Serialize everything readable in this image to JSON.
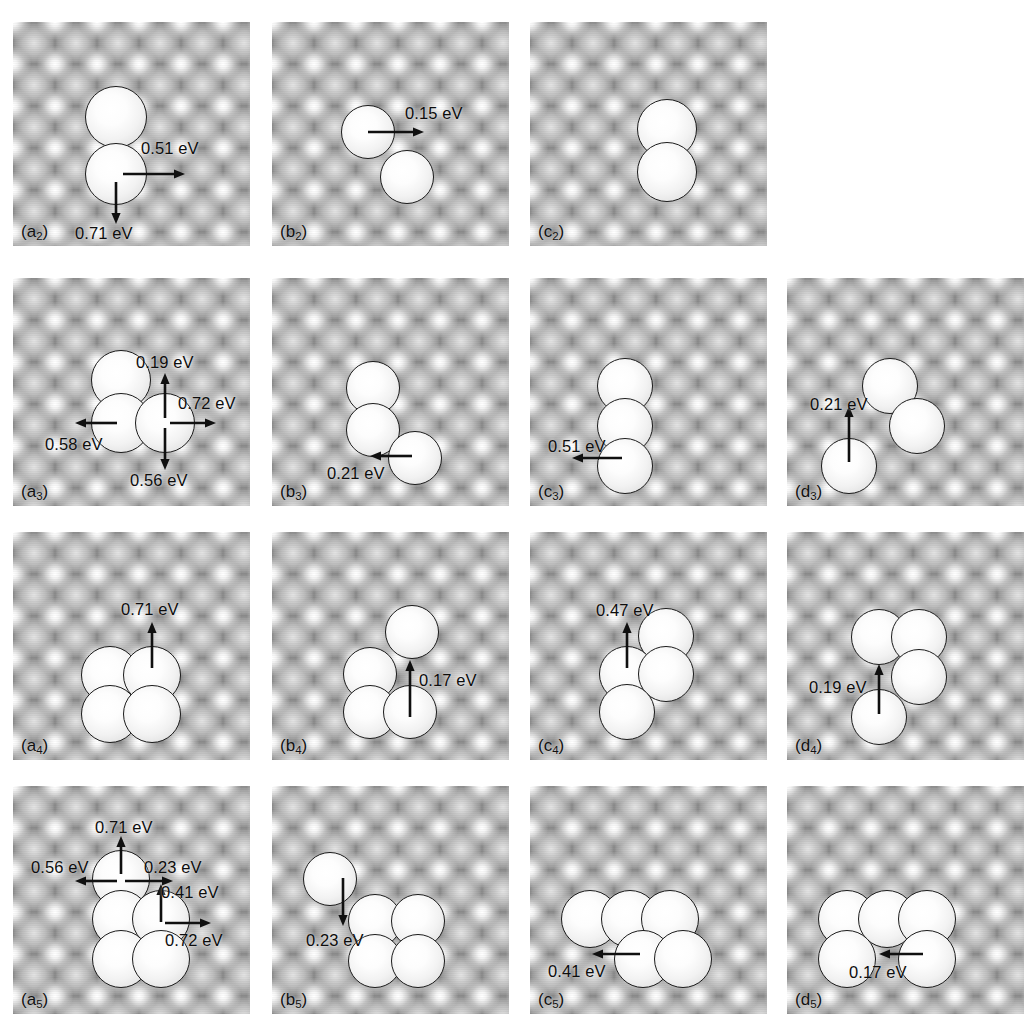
{
  "figure": {
    "kind": "surface-diffusion-mechanism-figure",
    "energy_unit": "eV",
    "columns": 4,
    "rows": 4
  },
  "panels": [
    {
      "id": "a2",
      "caption_main": "(a",
      "caption_sub": "2",
      "caption_tail": ")",
      "cluster_size": 2,
      "col": 0,
      "row": 0,
      "x": 13,
      "y": 22,
      "w": 237,
      "h": 224,
      "atoms": [
        {
          "cx": 103,
          "cy": 95,
          "r": 31
        },
        {
          "cx": 103,
          "cy": 152,
          "r": 31
        }
      ],
      "arrows": [
        {
          "name": "arrow-right",
          "x1": 110,
          "y1": 152,
          "x2": 172,
          "y2": 152
        },
        {
          "name": "arrow-down",
          "x1": 103,
          "y1": 160,
          "x2": 103,
          "y2": 202
        }
      ],
      "labels": [
        {
          "text": "0.51 eV",
          "x": 128,
          "y": 118,
          "value": 0.51
        },
        {
          "text": "0.71 eV",
          "x": 62,
          "y": 203,
          "value": 0.71
        }
      ]
    },
    {
      "id": "b2",
      "caption_main": "(b",
      "caption_sub": "2",
      "caption_tail": ")",
      "cluster_size": 2,
      "col": 1,
      "row": 0,
      "x": 272,
      "y": 22,
      "w": 237,
      "h": 224,
      "atoms": [
        {
          "cx": 96,
          "cy": 110,
          "r": 27
        },
        {
          "cx": 135,
          "cy": 155,
          "r": 27
        }
      ],
      "arrows": [
        {
          "name": "arrow-right",
          "x1": 96,
          "y1": 110,
          "x2": 152,
          "y2": 110
        }
      ],
      "labels": [
        {
          "text": "0.15 eV",
          "x": 133,
          "y": 83,
          "value": 0.15
        }
      ]
    },
    {
      "id": "c2",
      "caption_main": "(c",
      "caption_sub": "2",
      "caption_tail": ")",
      "cluster_size": 2,
      "col": 2,
      "row": 0,
      "x": 530,
      "y": 22,
      "w": 237,
      "h": 224,
      "atoms": [
        {
          "cx": 137,
          "cy": 107,
          "r": 30
        },
        {
          "cx": 137,
          "cy": 150,
          "r": 30
        }
      ],
      "arrows": [],
      "labels": []
    },
    {
      "id": "a3",
      "caption_main": "(a",
      "caption_sub": "3",
      "caption_tail": ")",
      "cluster_size": 3,
      "col": 0,
      "row": 1,
      "x": 13,
      "y": 278,
      "w": 237,
      "h": 228,
      "atoms": [
        {
          "cx": 108,
          "cy": 102,
          "r": 30
        },
        {
          "cx": 108,
          "cy": 145,
          "r": 30
        },
        {
          "cx": 152,
          "cy": 145,
          "r": 30
        }
      ],
      "arrows": [
        {
          "name": "arrow-up",
          "x1": 152,
          "y1": 140,
          "x2": 152,
          "y2": 95
        },
        {
          "name": "arrow-right",
          "x1": 157,
          "y1": 145,
          "x2": 203,
          "y2": 145
        },
        {
          "name": "arrow-left",
          "x1": 104,
          "y1": 145,
          "x2": 62,
          "y2": 145
        },
        {
          "name": "arrow-down",
          "x1": 152,
          "y1": 150,
          "x2": 152,
          "y2": 192
        }
      ],
      "labels": [
        {
          "text": "0.19 eV",
          "x": 123,
          "y": 76,
          "value": 0.19
        },
        {
          "text": "0.72 eV",
          "x": 165,
          "y": 117,
          "value": 0.72
        },
        {
          "text": "0.58 eV",
          "x": 32,
          "y": 158,
          "value": 0.58
        },
        {
          "text": "0.56 eV",
          "x": 117,
          "y": 194,
          "value": 0.56
        }
      ]
    },
    {
      "id": "b3",
      "caption_main": "(b",
      "caption_sub": "3",
      "caption_tail": ")",
      "cluster_size": 3,
      "col": 1,
      "row": 1,
      "x": 272,
      "y": 278,
      "w": 237,
      "h": 228,
      "atoms": [
        {
          "cx": 101,
          "cy": 110,
          "r": 27
        },
        {
          "cx": 101,
          "cy": 152,
          "r": 27
        },
        {
          "cx": 143,
          "cy": 180,
          "r": 27
        }
      ],
      "arrows": [
        {
          "name": "arrow-left",
          "x1": 140,
          "y1": 178,
          "x2": 98,
          "y2": 178
        }
      ],
      "labels": [
        {
          "text": "0.21 eV",
          "x": 55,
          "y": 187,
          "value": 0.21
        }
      ]
    },
    {
      "id": "c3",
      "caption_main": "(c",
      "caption_sub": "3",
      "caption_tail": ")",
      "cluster_size": 3,
      "col": 2,
      "row": 1,
      "x": 530,
      "y": 278,
      "w": 237,
      "h": 228,
      "atoms": [
        {
          "cx": 95,
          "cy": 108,
          "r": 28
        },
        {
          "cx": 95,
          "cy": 148,
          "r": 28
        },
        {
          "cx": 95,
          "cy": 188,
          "r": 28
        }
      ],
      "arrows": [
        {
          "name": "arrow-left",
          "x1": 92,
          "y1": 180,
          "x2": 42,
          "y2": 180
        }
      ],
      "labels": [
        {
          "text": "0.51 eV",
          "x": 18,
          "y": 160,
          "value": 0.51
        }
      ]
    },
    {
      "id": "d3",
      "caption_main": "(d",
      "caption_sub": "3",
      "caption_tail": ")",
      "cluster_size": 3,
      "col": 3,
      "row": 1,
      "x": 787,
      "y": 278,
      "w": 237,
      "h": 228,
      "atoms": [
        {
          "cx": 103,
          "cy": 108,
          "r": 28
        },
        {
          "cx": 130,
          "cy": 148,
          "r": 28
        },
        {
          "cx": 62,
          "cy": 188,
          "r": 28
        }
      ],
      "arrows": [
        {
          "name": "arrow-up",
          "x1": 62,
          "y1": 184,
          "x2": 62,
          "y2": 128
        }
      ],
      "labels": [
        {
          "text": "0.21 eV",
          "x": 23,
          "y": 118,
          "value": 0.21
        }
      ]
    },
    {
      "id": "a4",
      "caption_main": "(a",
      "caption_sub": "4",
      "caption_tail": ")",
      "cluster_size": 4,
      "col": 0,
      "row": 2,
      "x": 13,
      "y": 532,
      "w": 237,
      "h": 228,
      "atoms": [
        {
          "cx": 97,
          "cy": 143,
          "r": 29
        },
        {
          "cx": 139,
          "cy": 143,
          "r": 29
        },
        {
          "cx": 97,
          "cy": 182,
          "r": 29
        },
        {
          "cx": 139,
          "cy": 182,
          "r": 29
        }
      ],
      "arrows": [
        {
          "name": "arrow-up",
          "x1": 139,
          "y1": 136,
          "x2": 139,
          "y2": 90
        }
      ],
      "labels": [
        {
          "text": "0.71 eV",
          "x": 108,
          "y": 69,
          "value": 0.71
        }
      ]
    },
    {
      "id": "b4",
      "caption_main": "(b",
      "caption_sub": "4",
      "caption_tail": ")",
      "cluster_size": 4,
      "col": 1,
      "row": 2,
      "x": 272,
      "y": 532,
      "w": 237,
      "h": 228,
      "atoms": [
        {
          "cx": 140,
          "cy": 100,
          "r": 27
        },
        {
          "cx": 98,
          "cy": 142,
          "r": 27
        },
        {
          "cx": 98,
          "cy": 180,
          "r": 27
        },
        {
          "cx": 138,
          "cy": 180,
          "r": 27
        }
      ],
      "arrows": [
        {
          "name": "arrow-up",
          "x1": 138,
          "y1": 185,
          "x2": 138,
          "y2": 128
        }
      ],
      "labels": [
        {
          "text": "0.17 eV",
          "x": 147,
          "y": 140,
          "value": 0.17
        }
      ]
    },
    {
      "id": "c4",
      "caption_main": "(c",
      "caption_sub": "4",
      "caption_tail": ")",
      "cluster_size": 4,
      "col": 2,
      "row": 2,
      "x": 530,
      "y": 532,
      "w": 237,
      "h": 228,
      "atoms": [
        {
          "cx": 136,
          "cy": 104,
          "r": 28
        },
        {
          "cx": 97,
          "cy": 142,
          "r": 28
        },
        {
          "cx": 136,
          "cy": 142,
          "r": 28
        },
        {
          "cx": 97,
          "cy": 180,
          "r": 28
        }
      ],
      "arrows": [
        {
          "name": "arrow-up",
          "x1": 97,
          "y1": 136,
          "x2": 97,
          "y2": 90
        }
      ],
      "labels": [
        {
          "text": "0.47 eV",
          "x": 66,
          "y": 70,
          "value": 0.47
        }
      ]
    },
    {
      "id": "d4",
      "caption_main": "(d",
      "caption_sub": "4",
      "caption_tail": ")",
      "cluster_size": 4,
      "col": 3,
      "row": 2,
      "x": 787,
      "y": 532,
      "w": 237,
      "h": 228,
      "atoms": [
        {
          "cx": 92,
          "cy": 105,
          "r": 28
        },
        {
          "cx": 132,
          "cy": 105,
          "r": 28
        },
        {
          "cx": 132,
          "cy": 145,
          "r": 28
        },
        {
          "cx": 92,
          "cy": 185,
          "r": 28
        }
      ],
      "arrows": [
        {
          "name": "arrow-up",
          "x1": 92,
          "y1": 182,
          "x2": 92,
          "y2": 132
        }
      ],
      "labels": [
        {
          "text": "0.19 eV",
          "x": 22,
          "y": 147,
          "value": 0.19
        }
      ]
    },
    {
      "id": "a5",
      "caption_main": "(a",
      "caption_sub": "5",
      "caption_tail": ")",
      "cluster_size": 5,
      "col": 0,
      "row": 3,
      "x": 13,
      "y": 786,
      "w": 237,
      "h": 228,
      "atoms": [
        {
          "cx": 108,
          "cy": 93,
          "r": 29
        },
        {
          "cx": 108,
          "cy": 133,
          "r": 29
        },
        {
          "cx": 148,
          "cy": 133,
          "r": 29
        },
        {
          "cx": 108,
          "cy": 173,
          "r": 29
        },
        {
          "cx": 148,
          "cy": 173,
          "r": 29
        }
      ],
      "arrows": [
        {
          "name": "arrow-up",
          "x1": 108,
          "y1": 88,
          "x2": 108,
          "y2": 50
        },
        {
          "name": "arrow-left",
          "x1": 104,
          "y1": 95,
          "x2": 62,
          "y2": 95
        },
        {
          "name": "arrow-right",
          "x1": 112,
          "y1": 95,
          "x2": 160,
          "y2": 95
        },
        {
          "name": "arrow-up-2",
          "x1": 148,
          "y1": 136,
          "x2": 148,
          "y2": 98
        },
        {
          "name": "arrow-right-2",
          "x1": 152,
          "y1": 137,
          "x2": 198,
          "y2": 137
        }
      ],
      "labels": [
        {
          "text": "0.71 eV",
          "x": 82,
          "y": 33,
          "value": 0.71
        },
        {
          "text": "0.56 eV",
          "x": 18,
          "y": 73,
          "value": 0.56
        },
        {
          "text": "0.23 eV",
          "x": 131,
          "y": 73,
          "value": 0.23
        },
        {
          "text": "0.41 eV",
          "x": 148,
          "y": 98,
          "value": 0.41
        },
        {
          "text": "0.72 eV",
          "x": 152,
          "y": 146,
          "value": 0.72
        }
      ]
    },
    {
      "id": "b5",
      "caption_main": "(b",
      "caption_sub": "5",
      "caption_tail": ")",
      "cluster_size": 5,
      "col": 1,
      "row": 3,
      "x": 272,
      "y": 786,
      "w": 237,
      "h": 228,
      "atoms": [
        {
          "cx": 58,
          "cy": 93,
          "r": 27
        },
        {
          "cx": 103,
          "cy": 135,
          "r": 27
        },
        {
          "cx": 146,
          "cy": 135,
          "r": 27
        },
        {
          "cx": 103,
          "cy": 175,
          "r": 27
        },
        {
          "cx": 146,
          "cy": 175,
          "r": 27
        }
      ],
      "arrows": [
        {
          "name": "arrow-down",
          "x1": 71,
          "y1": 92,
          "x2": 71,
          "y2": 140
        }
      ],
      "labels": [
        {
          "text": "0.23 eV",
          "x": 34,
          "y": 146,
          "value": 0.23
        }
      ]
    },
    {
      "id": "c5",
      "caption_main": "(c",
      "caption_sub": "5",
      "caption_tail": ")",
      "cluster_size": 5,
      "col": 2,
      "row": 3,
      "x": 530,
      "y": 786,
      "w": 237,
      "h": 228,
      "atoms": [
        {
          "cx": 60,
          "cy": 133,
          "r": 29
        },
        {
          "cx": 100,
          "cy": 133,
          "r": 29
        },
        {
          "cx": 140,
          "cy": 133,
          "r": 29
        },
        {
          "cx": 113,
          "cy": 173,
          "r": 29
        },
        {
          "cx": 153,
          "cy": 173,
          "r": 29
        }
      ],
      "arrows": [
        {
          "name": "arrow-left",
          "x1": 110,
          "y1": 168,
          "x2": 62,
          "y2": 168
        }
      ],
      "labels": [
        {
          "text": "0.41 eV",
          "x": 18,
          "y": 177,
          "value": 0.41
        }
      ]
    },
    {
      "id": "d5",
      "caption_main": "(d",
      "caption_sub": "5",
      "caption_tail": ")",
      "cluster_size": 5,
      "col": 3,
      "row": 3,
      "x": 787,
      "y": 786,
      "w": 237,
      "h": 228,
      "atoms": [
        {
          "cx": 60,
          "cy": 133,
          "r": 29
        },
        {
          "cx": 100,
          "cy": 133,
          "r": 29
        },
        {
          "cx": 140,
          "cy": 133,
          "r": 29
        },
        {
          "cx": 60,
          "cy": 173,
          "r": 29
        },
        {
          "cx": 140,
          "cy": 173,
          "r": 29
        }
      ],
      "arrows": [
        {
          "name": "arrow-left",
          "x1": 136,
          "y1": 168,
          "x2": 92,
          "y2": 168
        }
      ],
      "labels": [
        {
          "text": "0.17 eV",
          "x": 62,
          "y": 178,
          "value": 0.17
        }
      ]
    }
  ],
  "chart_data": {
    "type": "table",
    "xlabel": "",
    "ylabel": "",
    "legend": [],
    "columns": [
      "panel",
      "cluster_size",
      "barriers_eV"
    ],
    "rows": [
      {
        "panel": "(a2)",
        "cluster_size": 2,
        "barriers_eV": [
          0.51,
          0.71
        ]
      },
      {
        "panel": "(b2)",
        "cluster_size": 2,
        "barriers_eV": [
          0.15
        ]
      },
      {
        "panel": "(c2)",
        "cluster_size": 2,
        "barriers_eV": []
      },
      {
        "panel": "(a3)",
        "cluster_size": 3,
        "barriers_eV": [
          0.19,
          0.72,
          0.58,
          0.56
        ]
      },
      {
        "panel": "(b3)",
        "cluster_size": 3,
        "barriers_eV": [
          0.21
        ]
      },
      {
        "panel": "(c3)",
        "cluster_size": 3,
        "barriers_eV": [
          0.51
        ]
      },
      {
        "panel": "(d3)",
        "cluster_size": 3,
        "barriers_eV": [
          0.21
        ]
      },
      {
        "panel": "(a4)",
        "cluster_size": 4,
        "barriers_eV": [
          0.71
        ]
      },
      {
        "panel": "(b4)",
        "cluster_size": 4,
        "barriers_eV": [
          0.17
        ]
      },
      {
        "panel": "(c4)",
        "cluster_size": 4,
        "barriers_eV": [
          0.47
        ]
      },
      {
        "panel": "(d4)",
        "cluster_size": 4,
        "barriers_eV": [
          0.19
        ]
      },
      {
        "panel": "(a5)",
        "cluster_size": 5,
        "barriers_eV": [
          0.71,
          0.56,
          0.23,
          0.41,
          0.72
        ]
      },
      {
        "panel": "(b5)",
        "cluster_size": 5,
        "barriers_eV": [
          0.23
        ]
      },
      {
        "panel": "(c5)",
        "cluster_size": 5,
        "barriers_eV": [
          0.41
        ]
      },
      {
        "panel": "(d5)",
        "cluster_size": 5,
        "barriers_eV": [
          0.17
        ]
      }
    ]
  }
}
